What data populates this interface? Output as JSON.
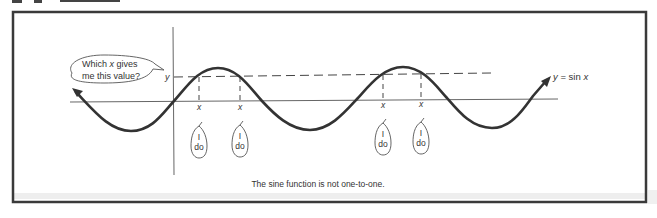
{
  "figure": {
    "caption": "The sine function is not one-to-one.",
    "function_label_y": "y",
    "function_label_eq": " = sin ",
    "function_label_x": "x",
    "y_value_label": "y",
    "thought_bubble": {
      "line1_a": "Which ",
      "line1_x": "x",
      "line1_b": " gives",
      "line2": "me this value?"
    },
    "x_labels": [
      "x",
      "x",
      "x",
      "x"
    ],
    "answer_bubbles": [
      {
        "line1": "I",
        "line2": "do"
      },
      {
        "line1": "I",
        "line2": "do"
      },
      {
        "line1": "I",
        "line2": "do"
      },
      {
        "line1": "I",
        "line2": "do"
      }
    ],
    "colors": {
      "frame": "#3a3a3a",
      "curve": "#333333",
      "axis": "#666666",
      "text": "#333333"
    }
  }
}
